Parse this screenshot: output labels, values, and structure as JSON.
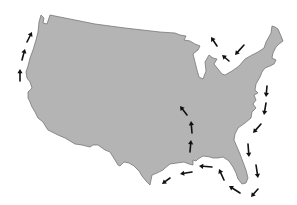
{
  "map": {
    "subject": "Contiguous United States outline",
    "colors": {
      "land": "#b4b4b4",
      "border": "#6a6a6a",
      "arrows": "#111111",
      "background": "#ffffff"
    },
    "arrow_groups": [
      {
        "name": "pacific-coast",
        "direction": "northward",
        "count": 3
      },
      {
        "name": "great-lakes",
        "direction": "westward/northwest",
        "count": 3
      },
      {
        "name": "atlantic-coast",
        "direction": "southward",
        "count": 5
      },
      {
        "name": "florida-tip",
        "direction": "westward",
        "count": 2
      },
      {
        "name": "gulf-coast",
        "direction": "westward",
        "count": 4
      },
      {
        "name": "mississippi-inland",
        "direction": "northward",
        "count": 3
      }
    ],
    "arrows": [
      {
        "group": "pacific-coast",
        "x1": 20,
        "y1": 81,
        "x2": 20,
        "y2": 69
      },
      {
        "group": "pacific-coast",
        "x1": 22,
        "y1": 60,
        "x2": 25,
        "y2": 49
      },
      {
        "group": "pacific-coast",
        "x1": 27,
        "y1": 42,
        "x2": 32,
        "y2": 32
      },
      {
        "group": "great-lakes",
        "x1": 217,
        "y1": 46,
        "x2": 211,
        "y2": 37
      },
      {
        "group": "great-lakes",
        "x1": 229,
        "y1": 61,
        "x2": 222,
        "y2": 55
      },
      {
        "group": "great-lakes",
        "x1": 244,
        "y1": 45,
        "x2": 235,
        "y2": 55
      },
      {
        "group": "atlantic-coast",
        "x1": 267,
        "y1": 86,
        "x2": 266,
        "y2": 97
      },
      {
        "group": "atlantic-coast",
        "x1": 266,
        "y1": 103,
        "x2": 264,
        "y2": 115
      },
      {
        "group": "atlantic-coast",
        "x1": 261,
        "y1": 124,
        "x2": 253,
        "y2": 133
      },
      {
        "group": "atlantic-coast",
        "x1": 248,
        "y1": 144,
        "x2": 249,
        "y2": 157
      },
      {
        "group": "atlantic-coast",
        "x1": 256,
        "y1": 165,
        "x2": 258,
        "y2": 178
      },
      {
        "group": "florida-tip",
        "x1": 258,
        "y1": 189,
        "x2": 251,
        "y2": 197
      },
      {
        "group": "florida-tip",
        "x1": 240,
        "y1": 193,
        "x2": 229,
        "y2": 186
      },
      {
        "group": "gulf-coast",
        "x1": 224,
        "y1": 180,
        "x2": 219,
        "y2": 169
      },
      {
        "group": "gulf-coast",
        "x1": 212,
        "y1": 167,
        "x2": 199,
        "y2": 166
      },
      {
        "group": "gulf-coast",
        "x1": 192,
        "y1": 172,
        "x2": 180,
        "y2": 174
      },
      {
        "group": "gulf-coast",
        "x1": 170,
        "y1": 178,
        "x2": 162,
        "y2": 184
      },
      {
        "group": "mississippi-inland",
        "x1": 190,
        "y1": 152,
        "x2": 191,
        "y2": 140
      },
      {
        "group": "mississippi-inland",
        "x1": 192,
        "y1": 133,
        "x2": 191,
        "y2": 121
      },
      {
        "group": "mississippi-inland",
        "x1": 187,
        "y1": 115,
        "x2": 180,
        "y2": 106
      }
    ]
  }
}
